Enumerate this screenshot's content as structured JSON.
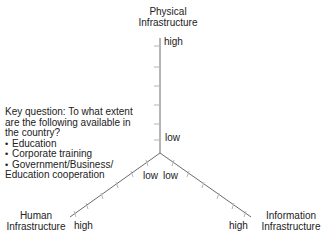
{
  "axes": {
    "physical": {
      "title_line1": "Physical",
      "title_line2": "Infrastructure",
      "high_label": "high",
      "low_label": "low"
    },
    "human": {
      "title_line1": "Human",
      "title_line2": "Infrastructure",
      "high_label": "high",
      "low_label": "low"
    },
    "information": {
      "title_line1": "Information",
      "title_line2": "Infrastructure",
      "high_label": "high",
      "low_label": "low"
    }
  },
  "key_question": {
    "line1": "Key question: To what extent",
    "line2": "are the following available in",
    "line3": "the country?",
    "items": [
      "Education",
      "Corporate training",
      "Government/Business/"
    ],
    "continuation": "Education cooperation"
  },
  "colors": {
    "axis": "#6b6b6b",
    "tick": "#b5b5b5",
    "text": "#222222"
  }
}
